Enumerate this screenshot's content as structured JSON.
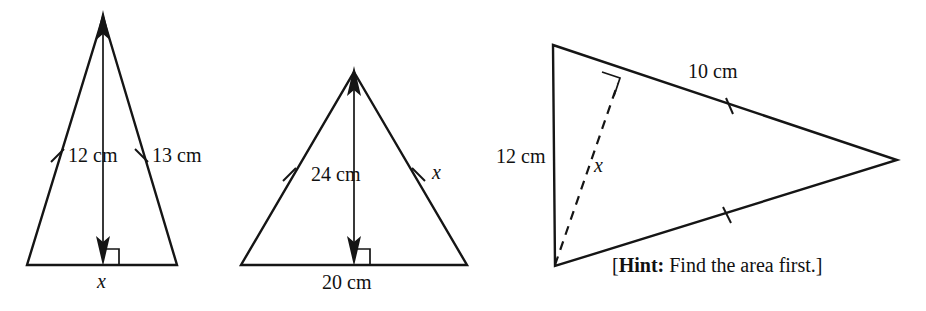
{
  "page": {
    "kind": "geometry-figure-set",
    "background_color": "#ffffff",
    "ink_color": "#151515"
  },
  "figures": [
    {
      "id": "triangle-1",
      "shape": "isosceles-triangle",
      "orientation": "apex-up",
      "labels": {
        "height": "12 cm",
        "leg": "13 cm",
        "base": "x"
      },
      "marks": {
        "equal_tick_count": 2,
        "right_angle_at_foot": true,
        "altitude_arrow": "double-headed-vertical"
      }
    },
    {
      "id": "triangle-2",
      "shape": "isosceles-triangle",
      "orientation": "apex-up",
      "labels": {
        "height": "24 cm",
        "leg": "x",
        "base": "20 cm"
      },
      "marks": {
        "equal_tick_count": 2,
        "right_angle_at_foot": true,
        "altitude_arrow": "double-headed-vertical"
      }
    },
    {
      "id": "triangle-3",
      "shape": "isosceles-triangle",
      "orientation": "apex-right",
      "labels": {
        "vertical_side": "12 cm",
        "upper_side": "10 cm",
        "altitude": "x"
      },
      "marks": {
        "equal_tick_count": 2,
        "right_angle_at_foot": true,
        "altitude_style": "dashed"
      }
    }
  ],
  "hint": {
    "open_bracket": "[",
    "lead": "Hint:",
    "text": " Find the area first.",
    "close_bracket": "]"
  }
}
